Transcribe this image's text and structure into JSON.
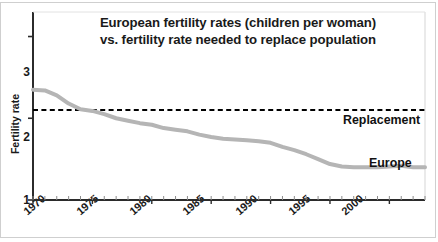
{
  "chart_data": {
    "type": "line",
    "title": "European fertility rates (children per woman) vs. fertility rate needed to replace population",
    "title_lines": [
      "European fertility rates (children per woman)",
      "vs. fertility rate needed to replace population"
    ],
    "xlabel": "",
    "ylabel": "Fertility rate",
    "xlim": [
      1970,
      2003
    ],
    "ylim": [
      1,
      3.3
    ],
    "yticks": [
      1,
      2,
      3
    ],
    "ytick_labels": [
      "1",
      "2",
      "3"
    ],
    "xticks": [
      1970,
      1975,
      1980,
      1985,
      1990,
      1995,
      2000
    ],
    "xtick_labels": [
      "1970",
      "1975",
      "1980",
      "1985",
      "1990",
      "1995",
      "2000"
    ],
    "minor_xtick_interval": 1,
    "grid": false,
    "legend_position": "inline-right",
    "series": [
      {
        "name": "Europe",
        "label": "Europe",
        "color": "#b5b5b5",
        "style": "solid",
        "width": 4,
        "x": [
          1970,
          1971,
          1972,
          1973,
          1974,
          1975,
          1976,
          1977,
          1978,
          1979,
          1980,
          1981,
          1982,
          1983,
          1984,
          1985,
          1986,
          1987,
          1988,
          1989,
          1990,
          1991,
          1992,
          1993,
          1994,
          1995,
          1996,
          1997,
          1998,
          1999,
          2000,
          2001,
          2002,
          2003
        ],
        "values": [
          2.35,
          2.34,
          2.28,
          2.18,
          2.11,
          2.09,
          2.05,
          2.0,
          1.97,
          1.94,
          1.92,
          1.88,
          1.86,
          1.84,
          1.8,
          1.77,
          1.75,
          1.74,
          1.73,
          1.72,
          1.7,
          1.65,
          1.61,
          1.56,
          1.5,
          1.44,
          1.41,
          1.4,
          1.4,
          1.4,
          1.41,
          1.42,
          1.4,
          1.4
        ]
      },
      {
        "name": "Replacement",
        "label": "Replacement",
        "color": "#000000",
        "style": "dashed",
        "width": 2,
        "constant_value": 2.1,
        "x": [
          1970,
          2003
        ],
        "values": [
          2.1,
          2.1
        ]
      }
    ]
  },
  "figure": {
    "ylabel": "Fertility rate",
    "replacement_label": "Replacement",
    "europe_label": "Europe"
  }
}
